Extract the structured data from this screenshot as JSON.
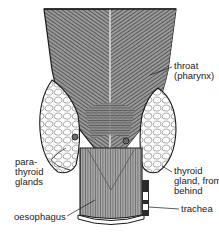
{
  "figure": {
    "labels": {
      "throat": "throat\n(pharynx)",
      "parathyroid": "para-\nthyroid\nglands",
      "thyroid": "thyroid\ngland, from\nbehind",
      "trachea": "trachea",
      "oesophagus": "oesophagus"
    },
    "colors": {
      "ink": "#1a1a1a",
      "shade_dark": "#555555",
      "shade_mid": "#8a8a8a",
      "shade_light": "#c8c8c8",
      "background": "#ffffff"
    }
  }
}
